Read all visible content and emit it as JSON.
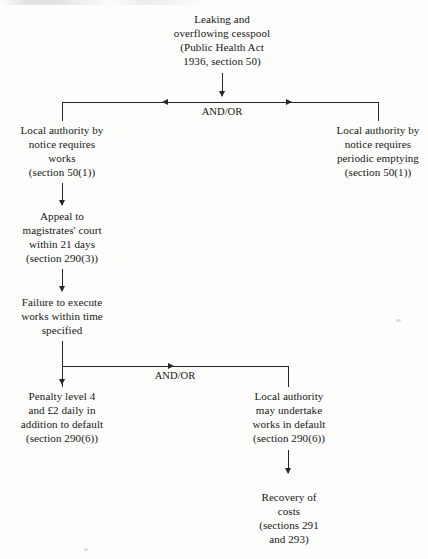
{
  "diagram": {
    "line_color": "#262626",
    "text_color": "#171717",
    "background_color": "#fdfdfb"
  },
  "nodes": {
    "start": "Leaking and\noverflowing cesspool\n(Public Health Act\n1936, section 50)",
    "left_branch": "Local authority by\nnotice requires\nworks\n(section 50(1))",
    "right_branch": "Local authority by\nnotice requires\nperiodic emptying\n(section 50(1))",
    "appeal": "Appeal to\nmagistrates' court\nwithin 21 days\n(section 290(3))",
    "failure": "Failure to execute\nworks within time\nspecified",
    "penalty": "Penalty level 4\nand £2 daily in\naddition to default\n(section 290(6))",
    "works_in_default": "Local authority\nmay undertake\nworks in default\n(section 290(6))",
    "recovery": "Recovery of\ncosts\n(sections 291\nand 293)"
  },
  "junctions": {
    "top_label": "AND/OR",
    "lower_label": "AND/OR"
  }
}
